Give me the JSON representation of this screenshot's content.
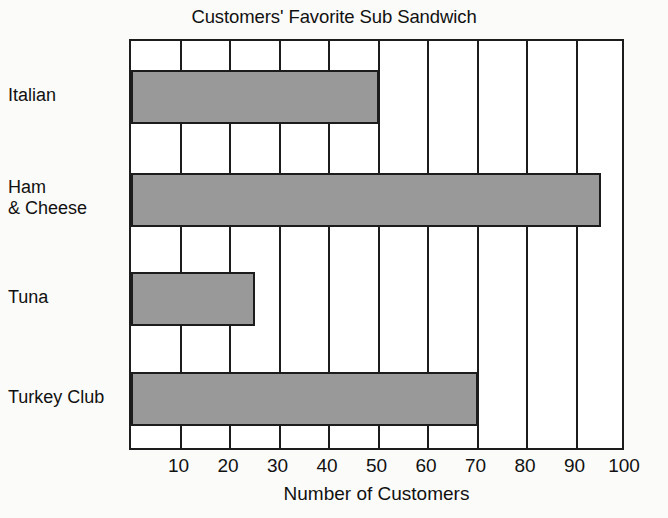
{
  "chart_data": {
    "type": "bar",
    "orientation": "horizontal",
    "title": "Customers' Favorite Sub Sandwich",
    "xlabel": "Number of Customers",
    "ylabel": "",
    "categories": [
      "Italian",
      "Ham\n& Cheese",
      "Tuna",
      "Turkey Club"
    ],
    "values": [
      50,
      95,
      25,
      70
    ],
    "xlim": [
      0,
      100
    ],
    "xticks": [
      10,
      20,
      30,
      40,
      50,
      60,
      70,
      80,
      90,
      100
    ],
    "xtick_labels": [
      "10",
      "20",
      "30",
      "40",
      "50",
      "60",
      "70",
      "80",
      "90",
      "100"
    ],
    "grid": true,
    "legend": false,
    "bar_color": "#999999",
    "bar_edge_color": "#1c1c1c",
    "background_color": "#ffffff",
    "page_background_color": "#fbfbf9"
  }
}
